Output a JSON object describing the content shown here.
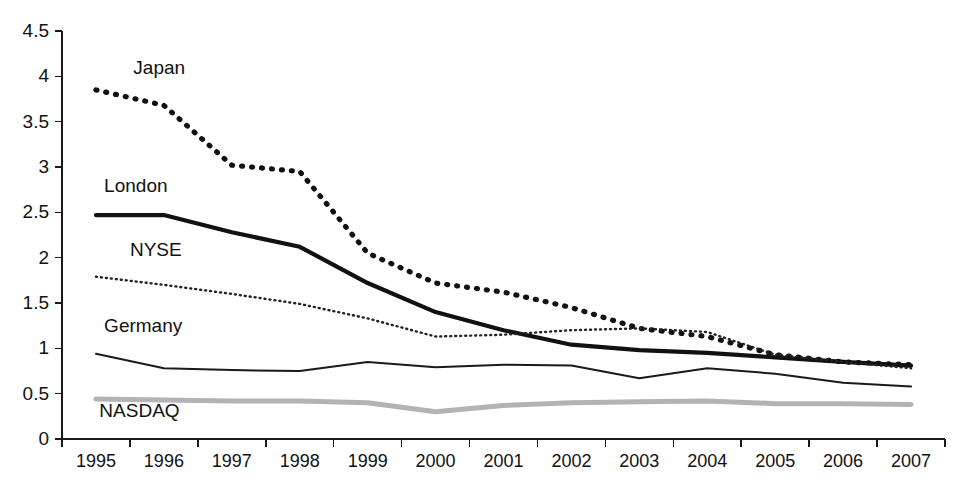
{
  "chart_data": {
    "type": "line",
    "title": "",
    "subtitle": "",
    "xlabel": "",
    "ylabel": "",
    "grid": false,
    "legend_position": "inline-labels",
    "categories": [
      "1995",
      "1996",
      "1997",
      "1998",
      "1999",
      "2000",
      "2001",
      "2002",
      "2003",
      "2004",
      "2005",
      "2006",
      "2007"
    ],
    "xlim": [
      "1995",
      "2007"
    ],
    "ylim": [
      0,
      4.5
    ],
    "ytick_labels": [
      "0",
      "0.5",
      "1",
      "1.5",
      "2",
      "2.5",
      "3",
      "3.5",
      "4",
      "4.5"
    ],
    "ytick_values": [
      0,
      0.5,
      1,
      1.5,
      2,
      2.5,
      3,
      3.5,
      4,
      4.5
    ],
    "series": [
      {
        "name": "Japan",
        "style": "dashed-thick",
        "color": "#111111",
        "stroke_width": 5.2,
        "dash": "1,9",
        "label_x": 1.05,
        "label_y": 4.03,
        "values": [
          3.85,
          3.68,
          3.02,
          2.95,
          2.05,
          1.72,
          1.62,
          1.45,
          1.22,
          1.13,
          0.93,
          0.85,
          0.82
        ]
      },
      {
        "name": "London",
        "style": "solid-thick",
        "color": "#111111",
        "stroke_width": 4.2,
        "dash": "",
        "label_x": 0.62,
        "label_y": 2.72,
        "values": [
          2.47,
          2.47,
          2.28,
          2.12,
          1.72,
          1.4,
          1.2,
          1.04,
          0.98,
          0.95,
          0.9,
          0.85,
          0.81
        ]
      },
      {
        "name": "NYSE",
        "style": "dotted-thin",
        "color": "#222222",
        "stroke_width": 2.4,
        "dash": "1,4",
        "label_x": 1.0,
        "label_y": 2.02,
        "values": [
          1.79,
          1.7,
          1.6,
          1.49,
          1.33,
          1.13,
          1.15,
          1.2,
          1.22,
          1.18,
          0.93,
          0.85,
          0.78
        ]
      },
      {
        "name": "Germany",
        "style": "solid-thin",
        "color": "#1a1a1a",
        "stroke_width": 2.0,
        "dash": "",
        "label_x": 0.62,
        "label_y": 1.18,
        "values": [
          0.94,
          0.78,
          0.76,
          0.75,
          0.85,
          0.79,
          0.82,
          0.81,
          0.67,
          0.78,
          0.72,
          0.62,
          0.58
        ]
      },
      {
        "name": "NASDAQ",
        "style": "solid-thick-gray",
        "color": "#b3b3b3",
        "stroke_width": 5.0,
        "dash": "",
        "label_x": 0.55,
        "label_y": 0.24,
        "values": [
          0.44,
          0.43,
          0.42,
          0.42,
          0.4,
          0.3,
          0.37,
          0.4,
          0.41,
          0.42,
          0.39,
          0.39,
          0.38
        ]
      }
    ]
  },
  "axes": {
    "axis_color": "#1a1a1a",
    "background": "#ffffff"
  },
  "caption": {
    "partial_text": ""
  }
}
